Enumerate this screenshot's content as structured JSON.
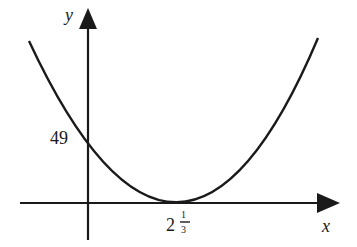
{
  "diagram": {
    "type": "parabola-graph",
    "axes": {
      "x_label": "x",
      "y_label": "y"
    },
    "labels": {
      "y_intercept": "49",
      "vertex_whole": "2",
      "vertex_num": "1",
      "vertex_den": "3"
    },
    "curve": {
      "shape": "upward parabola",
      "y_intercept": 49,
      "vertex_x": "2 1/3",
      "vertex_y": 0
    },
    "colors": {
      "stroke": "#1a1a1a",
      "background": "#ffffff"
    }
  }
}
